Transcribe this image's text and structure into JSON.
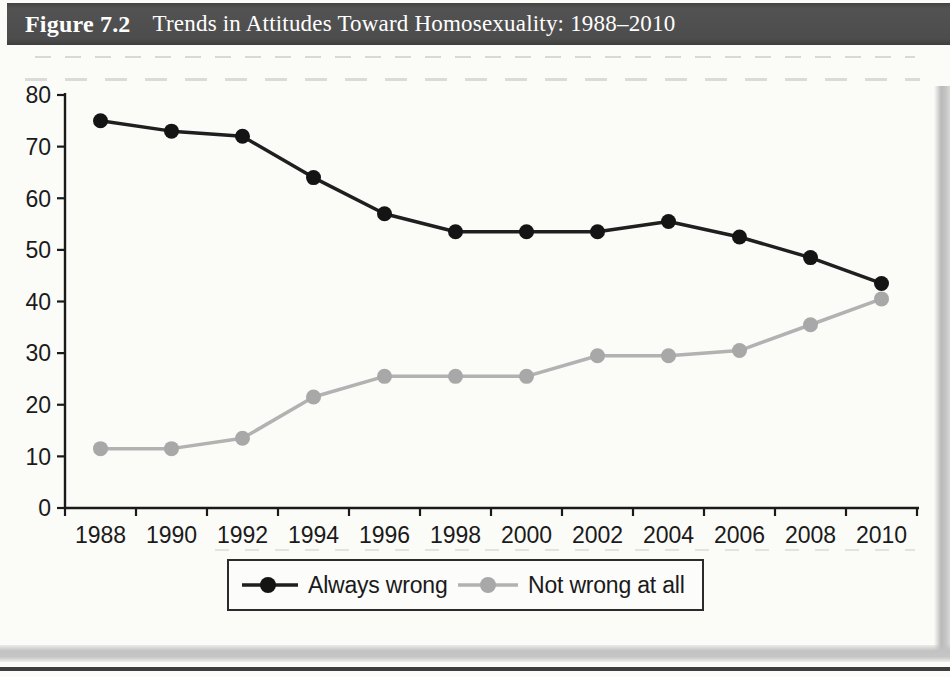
{
  "figure": {
    "label": "Figure 7.2",
    "title": "Trends in Attitudes Toward Homosexuality: 1988–2010"
  },
  "colors": {
    "header_bg": "#4d4d4d",
    "header_text": "#ffffff",
    "axis": "#1a1a1a",
    "legend_border": "#2b2b2b",
    "plot_bg": "#fbfbf8"
  },
  "chart_data": {
    "type": "line",
    "title": "Trends in Attitudes Toward Homosexuality: 1988–2010",
    "categories": [
      "1988",
      "1990",
      "1992",
      "1994",
      "1996",
      "1998",
      "2000",
      "2002",
      "2004",
      "2006",
      "2008",
      "2010"
    ],
    "series": [
      {
        "name": "Always wrong",
        "line_color": "#1f1f1f",
        "marker_color": "#141414",
        "values": [
          75,
          73,
          72,
          64,
          57,
          53.5,
          53.5,
          53.5,
          55.5,
          52.5,
          48.5,
          43.5
        ]
      },
      {
        "name": "Not wrong at all",
        "line_color": "#b2b2b2",
        "marker_color": "#a8a8a8",
        "values": [
          11.5,
          11.5,
          13.5,
          21.5,
          25.5,
          25.5,
          25.5,
          29.5,
          29.5,
          30.5,
          35.5,
          40.5
        ]
      }
    ],
    "xlabel": "",
    "ylabel": "",
    "ylim": [
      0,
      80
    ],
    "ytick_step": 10,
    "ytick_labels": [
      "0",
      "10",
      "20",
      "30",
      "40",
      "50",
      "60",
      "70",
      "80"
    ],
    "grid": false,
    "legend_position": "bottom",
    "marker": "circle"
  }
}
